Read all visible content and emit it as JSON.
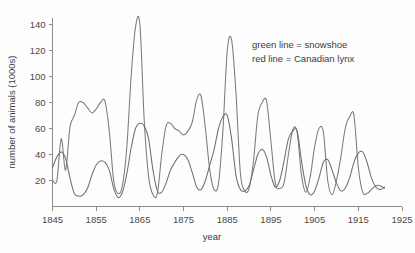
{
  "chart_data": {
    "type": "line",
    "title": "",
    "xlabel": "year",
    "ylabel": "number of animals (1000s)",
    "xlim": [
      1845,
      1925
    ],
    "ylim": [
      0,
      145
    ],
    "xticks": [
      1845,
      1855,
      1865,
      1875,
      1885,
      1895,
      1905,
      1915,
      1925
    ],
    "yticks": [
      20,
      40,
      60,
      80,
      100,
      120,
      140
    ],
    "grid": false,
    "legend_position": "upper-right-inside",
    "legend_style": "text-annotation",
    "annotations": [
      "green line = snowshoe",
      "red line = Canadian lynx"
    ],
    "x": [
      1845,
      1846,
      1847,
      1848,
      1849,
      1850,
      1851,
      1852,
      1853,
      1854,
      1855,
      1856,
      1857,
      1858,
      1859,
      1860,
      1861,
      1862,
      1863,
      1864,
      1865,
      1866,
      1867,
      1868,
      1869,
      1870,
      1871,
      1872,
      1873,
      1874,
      1875,
      1876,
      1877,
      1878,
      1879,
      1880,
      1881,
      1882,
      1883,
      1884,
      1885,
      1886,
      1887,
      1888,
      1889,
      1890,
      1891,
      1892,
      1893,
      1894,
      1895,
      1896,
      1897,
      1898,
      1899,
      1900,
      1901,
      1902,
      1903,
      1904,
      1905,
      1906,
      1907,
      1908,
      1909,
      1910,
      1911,
      1912,
      1913,
      1914,
      1915,
      1916,
      1917,
      1918,
      1919,
      1920,
      1921
    ],
    "series": [
      {
        "name": "snowshoe",
        "legend_label": "green line = snowshoe",
        "color_name": "green",
        "color": "#7a7a7a",
        "values": [
          20,
          20,
          52,
          28,
          61,
          70,
          80,
          80,
          76,
          72,
          75,
          80,
          81,
          58,
          20,
          10,
          16,
          45,
          100,
          138,
          140,
          66,
          23,
          9,
          10,
          40,
          62,
          64,
          60,
          58,
          55,
          58,
          65,
          82,
          85,
          60,
          28,
          13,
          18,
          58,
          120,
          128,
          87,
          26,
          12,
          14,
          35,
          70,
          80,
          81,
          50,
          18,
          14,
          18,
          40,
          59,
          57,
          24,
          11,
          23,
          46,
          60,
          57,
          20,
          9,
          20,
          38,
          60,
          69,
          70,
          30,
          11,
          10,
          13,
          16,
          16,
          14
        ]
      },
      {
        "name": "Canadian lynx",
        "legend_label": "red line = Canadian lynx",
        "color_name": "red",
        "color": "#6e6e6e",
        "values": [
          30,
          38,
          42,
          37,
          22,
          10,
          8,
          9,
          14,
          24,
          32,
          35,
          34,
          28,
          14,
          7,
          11,
          25,
          45,
          60,
          64,
          62,
          52,
          28,
          12,
          11,
          18,
          28,
          34,
          39,
          40,
          36,
          26,
          15,
          13,
          20,
          32,
          44,
          60,
          69,
          70,
          52,
          24,
          13,
          12,
          16,
          28,
          40,
          44,
          38,
          24,
          15,
          20,
          35,
          52,
          58,
          58,
          35,
          16,
          9,
          12,
          22,
          34,
          36,
          28,
          18,
          12,
          14,
          22,
          34,
          41,
          42,
          34,
          22,
          15,
          13,
          15
        ]
      }
    ]
  },
  "figure": {
    "background_color": "#fdfdfd",
    "axis_color": "#8c8c8c",
    "text_color": "#3c3c3c"
  }
}
